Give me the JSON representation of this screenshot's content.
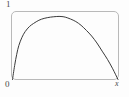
{
  "figure": {
    "name": "curve-plot",
    "frame": {
      "border_color": "#b9b9b9",
      "corner_radius": "5px"
    },
    "labels": {
      "y_max": "1",
      "origin": "0",
      "x_max": "x"
    }
  },
  "chart_data": {
    "type": "line",
    "title": "",
    "xlabel": "x",
    "ylabel": "",
    "xlim": [
      0,
      1
    ],
    "ylim": [
      0,
      1
    ],
    "grid": false,
    "legend": null,
    "line_color": "#3a3a3a",
    "line_width": 1,
    "tick_labels": {
      "x": [
        "0",
        "x"
      ],
      "y": [
        "0",
        "1"
      ]
    },
    "annotations": [],
    "series": [
      {
        "name": "curve",
        "x": [
          0.0,
          0.02,
          0.04,
          0.06,
          0.09,
          0.12,
          0.16,
          0.2,
          0.25,
          0.3,
          0.36,
          0.42,
          0.46,
          0.5,
          0.55,
          0.6,
          0.65,
          0.7,
          0.75,
          0.8,
          0.85,
          0.9,
          0.95,
          1.0
        ],
        "y": [
          0.0,
          0.22,
          0.4,
          0.54,
          0.67,
          0.76,
          0.84,
          0.89,
          0.94,
          0.97,
          0.99,
          1.0,
          1.0,
          0.99,
          0.96,
          0.92,
          0.86,
          0.78,
          0.69,
          0.58,
          0.45,
          0.32,
          0.17,
          0.0
        ]
      }
    ]
  }
}
